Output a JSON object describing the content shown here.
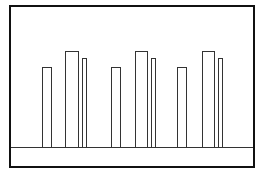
{
  "diagram": {
    "frame_color": "#111111",
    "bar_stroke": "#333333",
    "baseline_y": 148,
    "groups": [
      {
        "bars": [
          {
            "x": 42,
            "width": 10,
            "top": 67
          },
          {
            "x": 65,
            "width": 14,
            "top": 51
          },
          {
            "x": 82,
            "width": 5,
            "top": 58
          }
        ]
      },
      {
        "bars": [
          {
            "x": 111,
            "width": 10,
            "top": 67
          },
          {
            "x": 135,
            "width": 13,
            "top": 51
          },
          {
            "x": 151,
            "width": 5,
            "top": 58
          }
        ]
      },
      {
        "bars": [
          {
            "x": 177,
            "width": 10,
            "top": 67
          },
          {
            "x": 202,
            "width": 13,
            "top": 51
          },
          {
            "x": 218,
            "width": 5,
            "top": 58
          }
        ]
      }
    ]
  }
}
